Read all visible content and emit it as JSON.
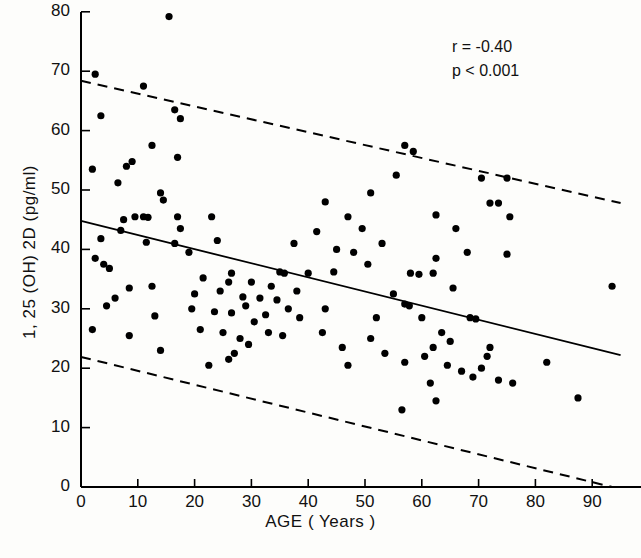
{
  "figure": {
    "title": "",
    "background": "#fdfdfb",
    "ink": "#000000"
  },
  "axes": {
    "x": {
      "label": "AGE ( Years )",
      "ticks": [
        0,
        10,
        20,
        30,
        40,
        50,
        60,
        70,
        80,
        90
      ],
      "tick_labels": [
        "0",
        "10",
        "20",
        "30",
        "40",
        "50",
        "60",
        "70",
        "80",
        "90"
      ],
      "range": [
        0,
        98
      ]
    },
    "y": {
      "label": "1, 25 (OH) 2D (pg/ml)",
      "ticks": [
        0,
        10,
        20,
        30,
        40,
        50,
        60,
        70,
        80
      ],
      "tick_labels": [
        "0",
        "10",
        "20",
        "30",
        "40",
        "50",
        "60",
        "70",
        "80"
      ],
      "range": [
        0,
        80
      ]
    }
  },
  "annotations": {
    "correlation": "r = -0.40",
    "pvalue": "p < 0.001"
  },
  "chart_data": {
    "type": "scatter",
    "title": "",
    "xlabel": "AGE ( Years )",
    "ylabel": "1, 25 (OH) 2D (pg/ml)",
    "xlim": [
      0,
      98
    ],
    "ylim": [
      0,
      80
    ],
    "grid": false,
    "legend": null,
    "marker": {
      "shape": "circle",
      "size_px": 5,
      "color": "#000000"
    },
    "annotations": [
      {
        "text": "r = -0.40",
        "x": 73,
        "y": 74
      },
      {
        "text": "p < 0.001",
        "x": 73,
        "y": 69
      }
    ],
    "series": [
      {
        "name": "1,25(OH)2D vs Age",
        "points": [
          [
            15.5,
            79.2
          ],
          [
            2.5,
            69.5
          ],
          [
            11.0,
            67.5
          ],
          [
            16.5,
            63.5
          ],
          [
            3.5,
            62.5
          ],
          [
            17.5,
            62.0
          ],
          [
            12.5,
            57.5
          ],
          [
            57.0,
            57.5
          ],
          [
            58.5,
            56.5
          ],
          [
            17.0,
            55.5
          ],
          [
            9.0,
            54.8
          ],
          [
            2.0,
            53.5
          ],
          [
            8.0,
            54.0
          ],
          [
            70.5,
            52.0
          ],
          [
            55.5,
            52.5
          ],
          [
            6.5,
            51.2
          ],
          [
            75.0,
            52.0
          ],
          [
            14.0,
            49.5
          ],
          [
            51.0,
            49.5
          ],
          [
            14.5,
            48.3
          ],
          [
            72.0,
            47.8
          ],
          [
            73.5,
            47.8
          ],
          [
            9.5,
            45.5
          ],
          [
            11.0,
            45.5
          ],
          [
            11.8,
            45.4
          ],
          [
            17.0,
            45.5
          ],
          [
            47.0,
            45.5
          ],
          [
            62.5,
            45.8
          ],
          [
            7.5,
            45.0
          ],
          [
            17.5,
            43.5
          ],
          [
            49.5,
            43.5
          ],
          [
            75.5,
            45.5
          ],
          [
            7.0,
            43.2
          ],
          [
            3.5,
            41.8
          ],
          [
            11.5,
            41.2
          ],
          [
            16.5,
            41.0
          ],
          [
            45.0,
            40.0
          ],
          [
            48.0,
            39.5
          ],
          [
            68.0,
            39.5
          ],
          [
            75.0,
            39.2
          ],
          [
            2.5,
            38.5
          ],
          [
            4.0,
            37.5
          ],
          [
            50.5,
            37.5
          ],
          [
            62.5,
            38.5
          ],
          [
            5.0,
            36.8
          ],
          [
            26.5,
            36.0
          ],
          [
            35.0,
            36.2
          ],
          [
            35.8,
            36.0
          ],
          [
            40.0,
            36.0
          ],
          [
            44.5,
            36.2
          ],
          [
            58.0,
            36.0
          ],
          [
            59.5,
            35.8
          ],
          [
            62.0,
            36.0
          ],
          [
            21.5,
            35.2
          ],
          [
            26.0,
            34.5
          ],
          [
            30.0,
            34.5
          ],
          [
            8.5,
            33.5
          ],
          [
            12.5,
            33.8
          ],
          [
            33.5,
            33.8
          ],
          [
            65.5,
            33.5
          ],
          [
            93.5,
            33.8
          ],
          [
            24.5,
            33.0
          ],
          [
            38.0,
            33.0
          ],
          [
            20.0,
            32.5
          ],
          [
            28.5,
            32.0
          ],
          [
            31.5,
            31.8
          ],
          [
            55.0,
            32.5
          ],
          [
            6.0,
            31.8
          ],
          [
            34.5,
            31.5
          ],
          [
            29.0,
            30.5
          ],
          [
            36.5,
            30.0
          ],
          [
            57.0,
            30.8
          ],
          [
            57.8,
            30.5
          ],
          [
            23.5,
            29.5
          ],
          [
            26.5,
            29.3
          ],
          [
            32.5,
            29.0
          ],
          [
            13.0,
            28.8
          ],
          [
            38.5,
            28.5
          ],
          [
            52.0,
            28.5
          ],
          [
            60.0,
            28.5
          ],
          [
            30.5,
            27.8
          ],
          [
            68.5,
            28.5
          ],
          [
            69.5,
            28.3
          ],
          [
            2.0,
            26.5
          ],
          [
            21.0,
            26.5
          ],
          [
            25.0,
            26.0
          ],
          [
            33.0,
            26.0
          ],
          [
            42.5,
            26.0
          ],
          [
            63.5,
            26.0
          ],
          [
            8.5,
            25.5
          ],
          [
            28.0,
            25.0
          ],
          [
            35.5,
            25.5
          ],
          [
            51.0,
            25.0
          ],
          [
            65.0,
            24.5
          ],
          [
            29.5,
            24.0
          ],
          [
            46.0,
            23.5
          ],
          [
            62.0,
            23.5
          ],
          [
            72.0,
            23.5
          ],
          [
            27.0,
            22.5
          ],
          [
            53.5,
            22.5
          ],
          [
            60.5,
            22.0
          ],
          [
            71.5,
            22.0
          ],
          [
            26.0,
            21.5
          ],
          [
            57.0,
            21.0
          ],
          [
            82.0,
            21.0
          ],
          [
            64.5,
            20.5
          ],
          [
            70.5,
            20.0
          ],
          [
            22.5,
            20.5
          ],
          [
            47.0,
            20.5
          ],
          [
            67.0,
            19.5
          ],
          [
            69.0,
            18.5
          ],
          [
            73.5,
            18.0
          ],
          [
            61.5,
            17.5
          ],
          [
            76.0,
            17.5
          ],
          [
            87.5,
            15.0
          ],
          [
            56.5,
            13.0
          ],
          [
            62.5,
            14.5
          ],
          [
            14.0,
            23.0
          ],
          [
            4.5,
            30.5
          ],
          [
            19.5,
            30.0
          ],
          [
            43.0,
            30.0
          ],
          [
            41.5,
            43.0
          ],
          [
            19.0,
            39.5
          ],
          [
            23.0,
            45.5
          ],
          [
            37.5,
            41.0
          ],
          [
            53.0,
            41.0
          ],
          [
            66.0,
            43.5
          ],
          [
            43.0,
            48.0
          ],
          [
            24.0,
            41.5
          ]
        ]
      }
    ],
    "lines": [
      {
        "name": "regression-line",
        "style": "solid",
        "x": [
          0,
          95
        ],
        "y": [
          44.8,
          22.2
        ]
      },
      {
        "name": "upper-confidence-line",
        "style": "dashed",
        "x": [
          0,
          95
        ],
        "y": [
          68.4,
          47.8
        ]
      },
      {
        "name": "lower-confidence-line",
        "style": "dashed",
        "x": [
          0,
          93.5
        ],
        "y": [
          21.9,
          0.0
        ]
      }
    ]
  }
}
